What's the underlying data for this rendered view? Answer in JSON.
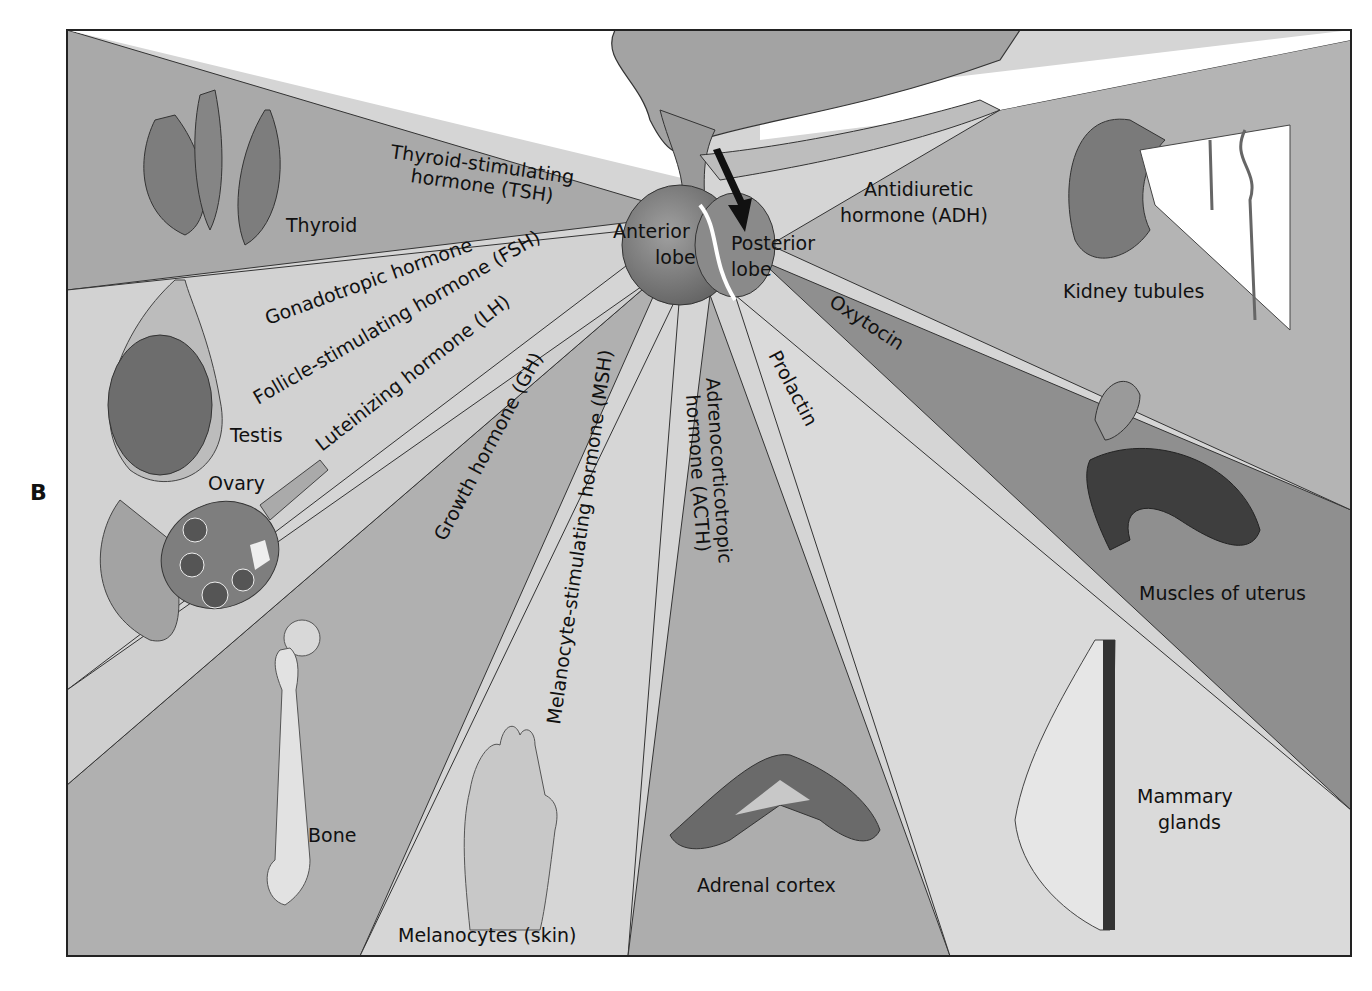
{
  "figure": {
    "panel_letter": "B",
    "pituitary": {
      "anterior_lobe_line1": "Anterior",
      "anterior_lobe_line2": "lobe",
      "posterior_lobe_line1": "Posterior",
      "posterior_lobe_line2": "lobe"
    },
    "hormones": {
      "tsh_line1": "Thyroid-stimulating",
      "tsh_line2": "hormone (TSH)",
      "gonadotropic": "Gonadotropic hormone",
      "fsh": "Follicle-stimulating hormone (FSH)",
      "lh": "Luteinizing hormone (LH)",
      "gh": "Growth hormone (GH)",
      "msh": "Melanocyte-stimulating hormone (MSH)",
      "acth_line1": "Adrenocorticotropic",
      "acth_line2": "hormone (ACTH)",
      "prolactin": "Prolactin",
      "oxytocin": "Oxytocin",
      "adh_line1": "Antidiuretic",
      "adh_line2": "hormone (ADH)"
    },
    "targets": {
      "thyroid": "Thyroid",
      "testis": "Testis",
      "ovary": "Ovary",
      "bone": "Bone",
      "melanocytes": "Melanocytes (skin)",
      "adrenal": "Adrenal cortex",
      "mammary_line1": "Mammary",
      "mammary_line2": "glands",
      "uterus": "Muscles of uterus",
      "kidney": "Kidney tubules"
    },
    "colors": {
      "dark_wedge": "#8e8e8e",
      "mid_wedge": "#a8a8a8",
      "light_wedge": "#cfcfcf",
      "very_light_wedge": "#d9d9d9",
      "gland": "#7a7a7a",
      "border": "#222222"
    }
  }
}
